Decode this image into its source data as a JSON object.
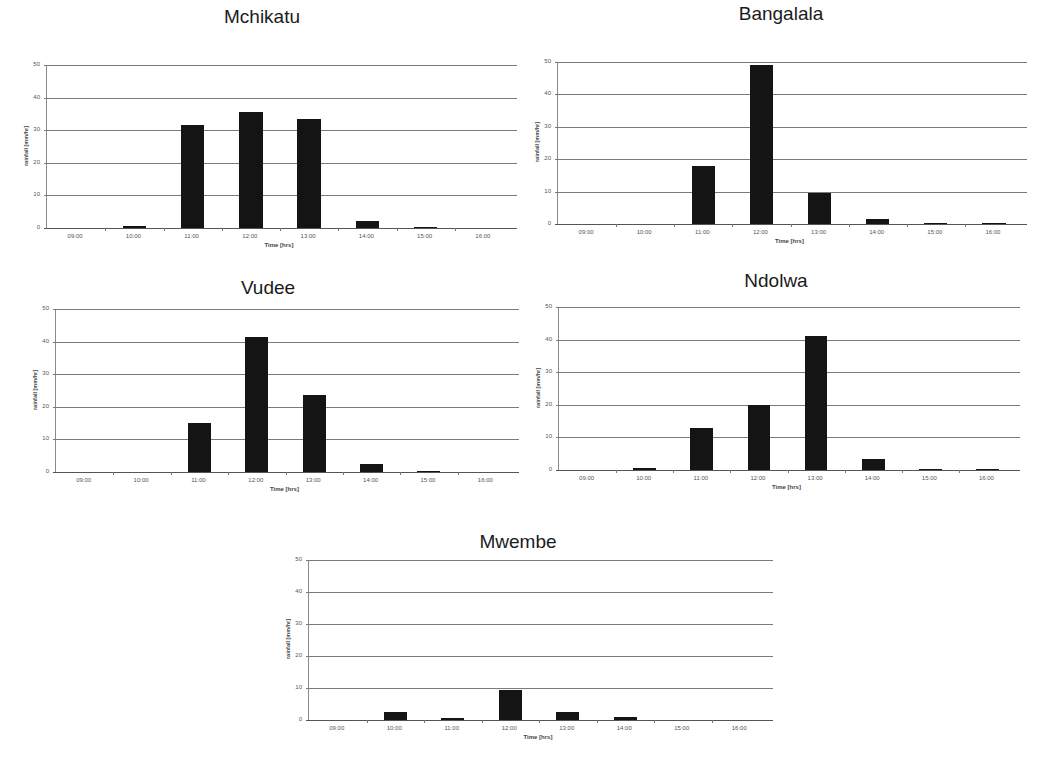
{
  "chart_data": [
    {
      "type": "bar",
      "title": "Mchikatu",
      "xlabel": "Time [hrs]",
      "ylabel": "rainfall [mm/hr]",
      "ylim": [
        0,
        50
      ],
      "yticks": [
        "0",
        "10",
        "20",
        "30",
        "40",
        "50"
      ],
      "grid": true,
      "categories": [
        "09:00",
        "10:00",
        "11:00",
        "12:00",
        "13:00",
        "14:00",
        "15:00",
        "16:00"
      ],
      "values": [
        0,
        0.5,
        31.5,
        35.5,
        33.5,
        2,
        0.2,
        0
      ]
    },
    {
      "type": "bar",
      "title": "Bangalala",
      "xlabel": "Time [hrs]",
      "ylabel": "rainfall [mm/hr]",
      "ylim": [
        0,
        50
      ],
      "yticks": [
        "0",
        "10",
        "20",
        "30",
        "40",
        "50"
      ],
      "grid": true,
      "categories": [
        "09:00",
        "10:00",
        "11:00",
        "12:00",
        "13:00",
        "14:00",
        "15:00",
        "16:00"
      ],
      "values": [
        0,
        0,
        18,
        49,
        9.5,
        1.5,
        0.2,
        0.3
      ]
    },
    {
      "type": "bar",
      "title": "Vudee",
      "xlabel": "Time [hrs]",
      "ylabel": "rainfall [mm/hr]",
      "ylim": [
        0,
        50
      ],
      "yticks": [
        "0",
        "10",
        "20",
        "30",
        "40",
        "50"
      ],
      "grid": true,
      "categories": [
        "09:00",
        "10:00",
        "11:00",
        "12:00",
        "13:00",
        "14:00",
        "15:00",
        "16:00"
      ],
      "values": [
        0,
        0,
        15,
        41.5,
        23.5,
        2.5,
        0.3,
        0
      ]
    },
    {
      "type": "bar",
      "title": "Ndolwa",
      "xlabel": "Time [hrs]",
      "ylabel": "rainfall [mm/hr]",
      "ylim": [
        0,
        50
      ],
      "yticks": [
        "0",
        "10",
        "20",
        "30",
        "40",
        "50"
      ],
      "grid": true,
      "categories": [
        "09:00",
        "10:00",
        "11:00",
        "12:00",
        "13:00",
        "14:00",
        "15:00",
        "16:00"
      ],
      "values": [
        0,
        0.5,
        13,
        20,
        41,
        3.5,
        0.3,
        0.2
      ]
    },
    {
      "type": "bar",
      "title": "Mwembe",
      "xlabel": "Time [hrs]",
      "ylabel": "rainfall [mm/hr]",
      "ylim": [
        0,
        50
      ],
      "yticks": [
        "0",
        "10",
        "20",
        "30",
        "40",
        "50"
      ],
      "grid": true,
      "categories": [
        "09:00",
        "10:00",
        "11:00",
        "12:00",
        "13:00",
        "14:00",
        "15:00",
        "16:00"
      ],
      "values": [
        0,
        2.5,
        0.5,
        9.5,
        2.5,
        1,
        0,
        0
      ]
    }
  ],
  "colors": {
    "bar": "#141414",
    "grid": "#7a7a7a",
    "background": "#ffffff"
  }
}
